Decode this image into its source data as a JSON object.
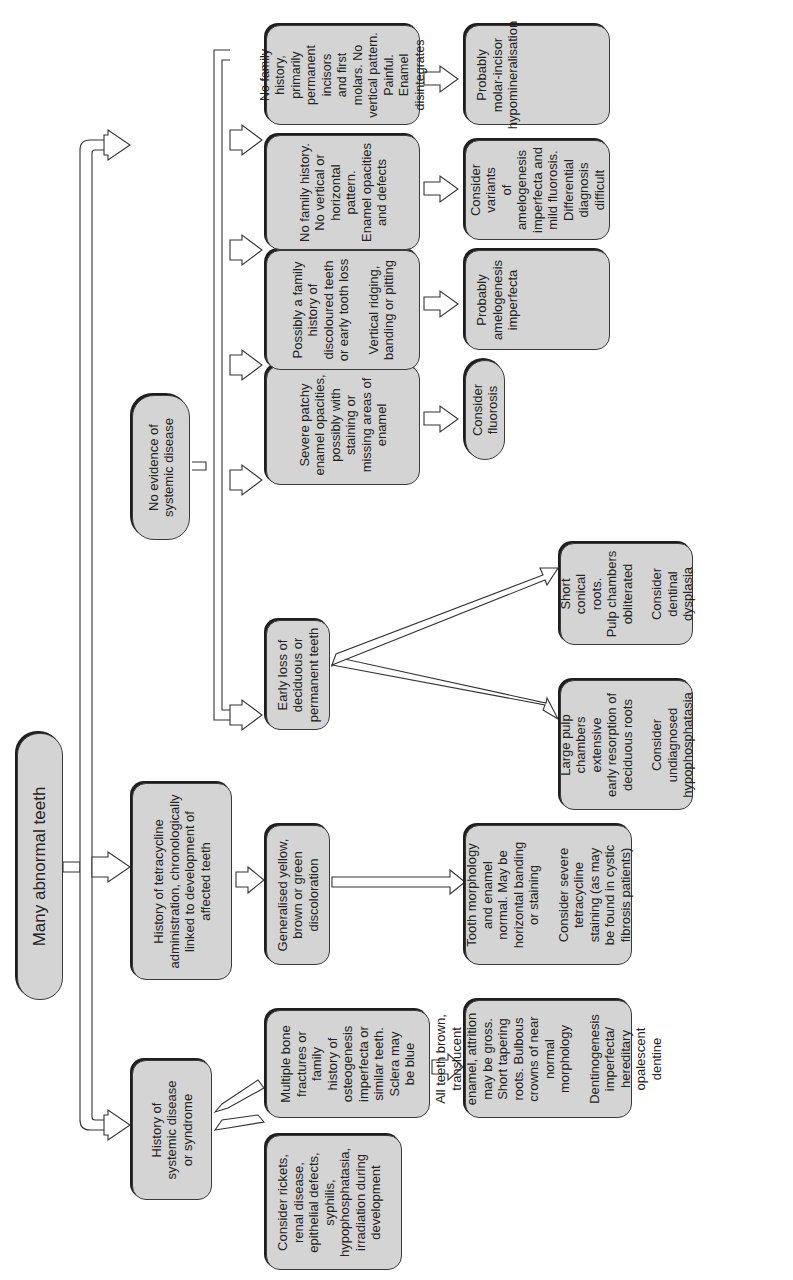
{
  "diagram": {
    "root": "Many abnormal teeth",
    "level1": {
      "systemic": "History of\nsystemic disease\nor syndrome",
      "tetracycline": "History of tetracycline\nadministration, chronologically\nlinked to development of\naffected teeth",
      "no_systemic": "No evidence of\nsystemic disease"
    },
    "systemic_branch": {
      "rickets": {
        "p1": "Consider rickets,\nrenal disease,\nepithelial defects,\nsyphilis,\nhypophosphatasia,\nirradiation during\ndevelopment",
        "p2": "Histology of a\ntooth may be\nhelpful but\nextraction is not\nwarranted for\ndiagnosis.\nExfoliated\ndeciduous teeth\nmay be informative"
      },
      "bone": "Multiple bone\nfractures or family\nhistory of\nosteogenesis\nimperfecta or\nsimilar teeth.\nSclera may\nbe blue",
      "bone_result": {
        "p1": "All teeth brown,\ntranslucent\nenamel, attrition\nmay be gross.\nShort tapering\nroots. Bulbous\ncrowns of near\nnormal morphology",
        "p2": "Dentinogenesis\nimperfecta/\nhereditary\nopalescent dentine"
      }
    },
    "tetracycline_branch": {
      "discoloration": "Generalised yellow,\nbrown or green\ndiscoloration",
      "result": {
        "p1": "Tooth morphology\nand enamel\nnormal. May be\nhorizontal banding\nor staining",
        "p2": "Consider severe\ntetracycline\nstaining (as may\nbe found in cystic\nfibrosis patients)"
      }
    },
    "no_systemic_branch": {
      "early_loss": "Early loss of\ndeciduous or\npermanent teeth",
      "large_pulp": {
        "p1": "Large pulp\nchambers\nextensive\nearly resorption of\ndeciduous roots",
        "p2": "Consider\nundiagnosed\nhypophosphatasia"
      },
      "short_roots": {
        "p1": "Short\nconical\nroots.\nPulp chambers\nobliterated",
        "p2": "Consider\ndentinal\ndysplasia"
      },
      "patchy": "Severe patchy\nenamel opacities,\npossibly with\nstaining or\nmissing areas of\nenamel",
      "fluorosis": "Consider fluorosis",
      "family": {
        "p1": "Possibly a family\nhistory of\ndiscoloured teeth\nor early tooth loss",
        "p2": "Vertical ridging,\nbanding or pitting"
      },
      "amelogenesis": "Probably\namelogenesis\nimperfecta",
      "no_family_opacities": "No family history.\nNo vertical or\nhorizontal pattern.\nEnamel opacities\nand defects",
      "variants": "Consider variants\nof amelogenesis\nimperfecta and\nmild fluorosis.\nDifferential\ndiagnosis difficult",
      "no_family_molars": "No family history,\nprimarily\npermanent incisors\nand first molars. No\nvertical pattern.\nPainful. Enamel\ndisintegrates",
      "mih": "Probably\nmolar-incisor\nhypomineralisation"
    },
    "colors": {
      "box_fill": "#d4d4d4",
      "box_border": "#3a3a3a",
      "arrow_fill": "#ffffff"
    }
  }
}
